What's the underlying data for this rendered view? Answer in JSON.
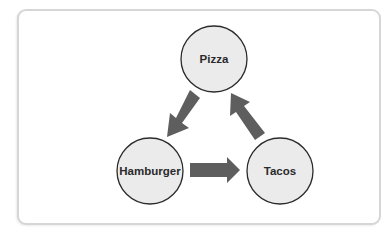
{
  "diagram": {
    "type": "cycle",
    "nodes": [
      {
        "id": "pizza",
        "label": "Pizza",
        "cx": 214,
        "cy": 59,
        "r": 33
      },
      {
        "id": "hamburger",
        "label": "Hamburger",
        "cx": 150,
        "cy": 171,
        "r": 33
      },
      {
        "id": "tacos",
        "label": "Tacos",
        "cx": 280,
        "cy": 171,
        "r": 33
      }
    ],
    "edges": [
      {
        "from": "pizza",
        "to": "hamburger"
      },
      {
        "from": "hamburger",
        "to": "tacos"
      },
      {
        "from": "tacos",
        "to": "pizza"
      }
    ],
    "colors": {
      "node_fill": "#ebebeb",
      "node_stroke": "#2b2b2b",
      "arrow_fill": "#5e5e5e",
      "panel_border": "#d6d6d6"
    }
  }
}
